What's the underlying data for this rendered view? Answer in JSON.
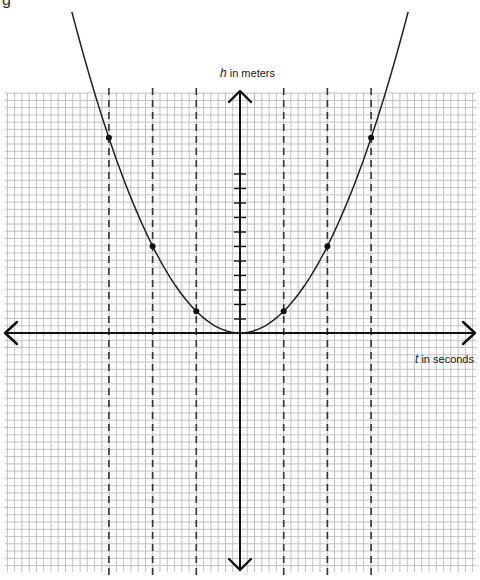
{
  "corner_glyph": "g",
  "axes": {
    "y_label_var": "h",
    "y_label_rest": " in meters",
    "x_label_var": "t",
    "x_label_rest": " in seconds"
  },
  "chart_data": {
    "type": "line",
    "title": "",
    "xlabel": "t in seconds",
    "ylabel": "h in meters",
    "grid": true,
    "legend": null,
    "x_ticks": [],
    "y_ticks_count_above_origin": 11,
    "series": [
      {
        "name": "h(t)",
        "shape": "parabola",
        "vertex": [
          0,
          0
        ],
        "points": [
          {
            "t": -3,
            "h": 13.5
          },
          {
            "t": -2,
            "h": 6
          },
          {
            "t": -1,
            "h": 1.5
          },
          {
            "t": 1,
            "h": 1.5
          },
          {
            "t": 2,
            "h": 6
          },
          {
            "t": 3,
            "h": 13.5
          }
        ]
      }
    ],
    "dashed_lines_t": [
      -3,
      -2,
      -1,
      1,
      2,
      3
    ],
    "units_note": "h values estimated in y-tick units (1 tick ≈ 2 grid squares)"
  },
  "render": {
    "origin_px": [
      240,
      333
    ],
    "grid": {
      "x0": 5,
      "x1": 476,
      "y0": 93,
      "y1": 572,
      "step": 7.27,
      "color": "#b4b4b4"
    },
    "t_unit_px": 43.7,
    "h_unit_px": 14.5,
    "curve_k_px": 21.7,
    "curve_top_px": 12,
    "dashed_top_px": 88,
    "dashed_bottom_px": 578,
    "y_axis": {
      "top": 91,
      "bottom": 570,
      "tick_first": 174,
      "tick_step": 14.5,
      "tick_count": 11,
      "tick_half": 6
    },
    "x_axis": {
      "left": 5,
      "right": 475
    },
    "axis_color": "#111111",
    "curve_color": "#222222",
    "dashed_color": "#333333",
    "point_radius": 3
  }
}
